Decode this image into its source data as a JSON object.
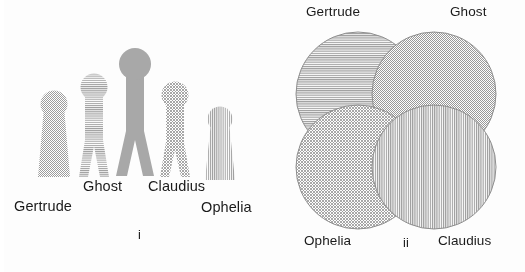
{
  "figure": {
    "background_color": "#fdfdfd",
    "text_color": "#1a1a1a",
    "figure_fill_color": "#a8a8a8",
    "outline_color": "#8e8e8e"
  },
  "panel_i": {
    "caption": "i",
    "characters": [
      {
        "name": "Gertrude",
        "texture": "dotted-checker",
        "body_shape": "cone-dress",
        "height_rank": 4,
        "label_x": 14,
        "label_y": 198
      },
      {
        "name": "Ghost",
        "texture": "horizontal-lines",
        "body_shape": "legs",
        "height_rank": 2,
        "label_x": 83,
        "label_y": 178
      },
      {
        "name": "",
        "texture": "solid",
        "body_shape": "legs",
        "height_rank": 1,
        "label_x": 0,
        "label_y": 0
      },
      {
        "name": "Claudius",
        "texture": "diagonal-crosshatch",
        "body_shape": "legs",
        "height_rank": 3,
        "label_x": 148,
        "label_y": 178
      },
      {
        "name": "Ophelia",
        "texture": "vertical-lines",
        "body_shape": "cone-dress",
        "height_rank": 5,
        "label_x": 201,
        "label_y": 199
      }
    ]
  },
  "panel_ii": {
    "caption": "ii",
    "diagram_type": "four-circle-venn",
    "sets": [
      {
        "name": "Gertrude",
        "position": "top-left",
        "texture": "horizontal-lines",
        "cx": 80,
        "cy": 94,
        "r": 62,
        "label_x": 28,
        "label_y": 4
      },
      {
        "name": "Ghost",
        "position": "top-right",
        "texture": "dotted-mesh",
        "cx": 156,
        "cy": 94,
        "r": 62,
        "label_x": 172,
        "label_y": 4
      },
      {
        "name": "Ophelia",
        "position": "bottom-left",
        "texture": "diagonal-crosshatch",
        "cx": 80,
        "cy": 167,
        "r": 62,
        "label_x": 26,
        "label_y": 233
      },
      {
        "name": "Claudius",
        "position": "bottom-right",
        "texture": "vertical-lines",
        "cx": 156,
        "cy": 167,
        "r": 62,
        "label_x": 160,
        "label_y": 233
      }
    ]
  }
}
